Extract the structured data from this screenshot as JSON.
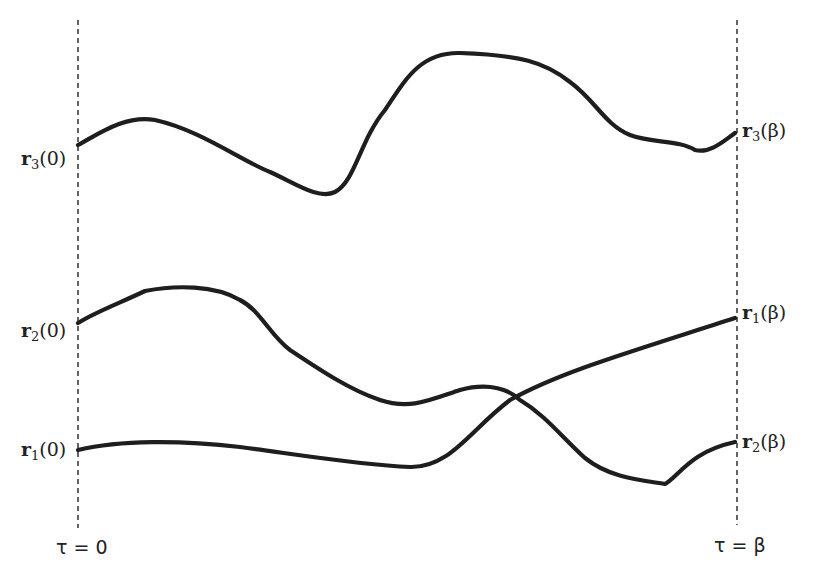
{
  "diagram": {
    "type": "imaginary-time particle paths",
    "boundaries": {
      "left": {
        "label": "τ = 0",
        "x": 78
      },
      "right": {
        "label": "τ = β",
        "x": 737
      }
    },
    "paths": [
      {
        "name": "r3",
        "start_label": {
          "vec": "r",
          "sub": "3",
          "arg": "(0)"
        },
        "end_label": {
          "vec": "r",
          "sub": "3",
          "arg": "(β)"
        },
        "d": "M78,145 C100,133 125,115 155,120 C200,130 240,160 270,172 C295,183 318,200 335,192 C355,182 360,140 385,110 C405,80 420,52 460,53 C520,55 545,62 570,82 C595,100 605,125 630,135 C650,143 680,140 695,150 C710,154 725,140 735,133"
      },
      {
        "name": "r2",
        "start_label": {
          "vec": "r",
          "sub": "2",
          "arg": "(0)"
        },
        "end_label": {
          "vec": "r",
          "sub": "1",
          "arg": "(β)"
        },
        "d": "M78,323 C95,312 120,303 145,291 C175,285 215,285 240,300 C260,310 270,335 290,350 C320,370 350,390 380,400 C410,410 430,400 460,390 C490,382 510,390 520,400 C545,415 560,435 585,458 C610,478 640,480 665,484 C680,475 690,452 735,442"
      },
      {
        "name": "r1",
        "start_label": {
          "vec": "r",
          "sub": "1",
          "arg": "(0)"
        },
        "end_label": {
          "vec": "r",
          "sub": "2",
          "arg": "(β)"
        },
        "d": "M78,450 C120,440 180,440 240,447 C300,455 360,465 410,467 C450,468 470,430 510,400 C560,372 630,352 735,318"
      }
    ]
  },
  "labels": {
    "left": [
      {
        "vec": "r",
        "sub": "3",
        "arg": "(0)"
      },
      {
        "vec": "r",
        "sub": "2",
        "arg": "(0)"
      },
      {
        "vec": "r",
        "sub": "1",
        "arg": "(0)"
      }
    ],
    "right": [
      {
        "vec": "r",
        "sub": "3",
        "arg": "(β)"
      },
      {
        "vec": "r",
        "sub": "1",
        "arg": "(β)"
      },
      {
        "vec": "r",
        "sub": "2",
        "arg": "(β)"
      }
    ],
    "tau_start": "τ = 0",
    "tau_end": "τ = β"
  }
}
